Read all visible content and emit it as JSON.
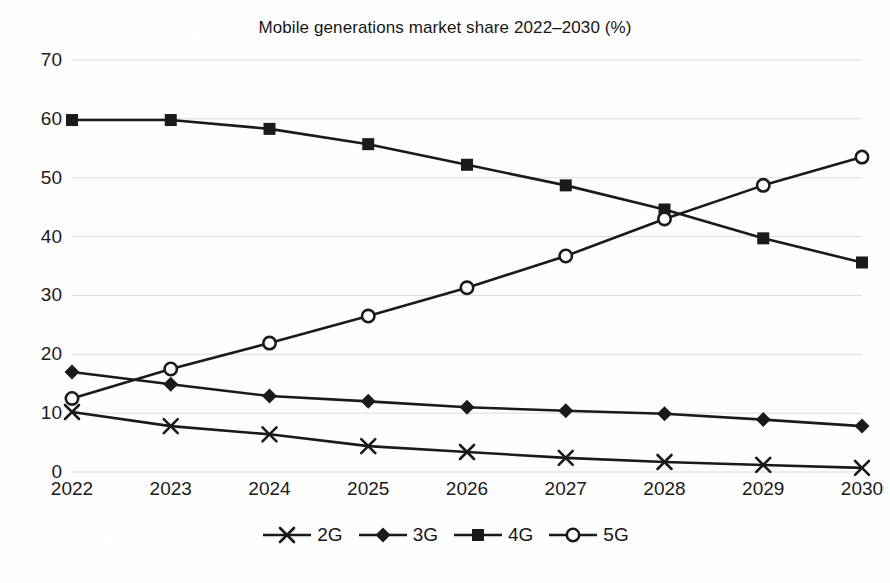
{
  "chart_data": {
    "type": "line",
    "title": "Mobile generations market share 2022–2030 (%)",
    "xlabel": "",
    "ylabel": "",
    "categories": [
      "2022",
      "2023",
      "2024",
      "2025",
      "2026",
      "2027",
      "2028",
      "2029",
      "2030"
    ],
    "ylim": [
      0,
      70
    ],
    "ytick_step": 10,
    "yticks": [
      "70",
      "60",
      "50",
      "40",
      "30",
      "20",
      "10",
      "0"
    ],
    "grid": "horizontal",
    "legend_position": "bottom-center",
    "series": [
      {
        "name": "2G",
        "marker": "x-cross",
        "color": "#1a1a1a",
        "values": [
          10.2,
          7.8,
          6.4,
          4.4,
          3.4,
          2.4,
          1.7,
          1.2,
          0.7
        ]
      },
      {
        "name": "3G",
        "marker": "diamond-filled",
        "color": "#1a1a1a",
        "values": [
          17.0,
          14.9,
          12.9,
          12.0,
          11.0,
          10.4,
          9.9,
          8.9,
          7.8
        ]
      },
      {
        "name": "4G",
        "marker": "square-filled",
        "color": "#1a1a1a",
        "values": [
          59.8,
          59.8,
          58.3,
          55.7,
          52.2,
          48.7,
          44.6,
          39.7,
          35.6
        ]
      },
      {
        "name": "5G",
        "marker": "circle-open",
        "color": "#1a1a1a",
        "values": [
          12.5,
          17.5,
          21.9,
          26.5,
          31.3,
          36.7,
          43.0,
          48.7,
          53.5
        ]
      }
    ]
  },
  "style": {
    "axis_text_color": "#1b1b1b",
    "line_color": "#1a1a1a",
    "grid_color": "#dcdcdc",
    "background": "#ffffff"
  }
}
